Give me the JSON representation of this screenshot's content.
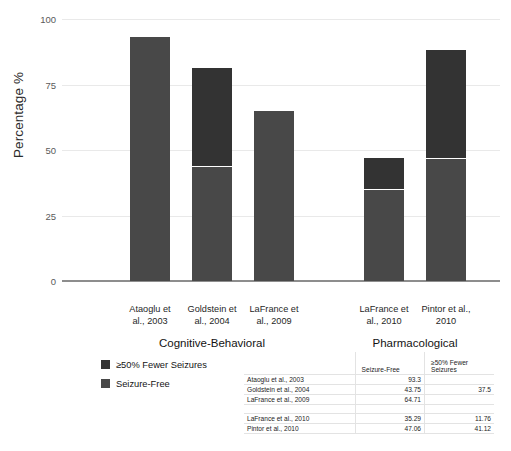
{
  "chart_data": {
    "type": "bar",
    "subtype": "stacked-bar",
    "title": "",
    "xlabel": "",
    "ylabel": "Percentage %",
    "ylim": [
      0,
      100
    ],
    "yticks": [
      0,
      25,
      50,
      75,
      100
    ],
    "ytick_labels": [
      "0",
      "25",
      "50",
      "75",
      "100"
    ],
    "grid": true,
    "legend_position": "below-left",
    "categories": [
      "Ataoglu et al., 2003",
      "Goldstein et al., 2004",
      "LaFrance et al., 2009",
      "LaFrance et al., 2010",
      "Pintor et al., 2010"
    ],
    "category_lines": [
      [
        "Ataoglu et",
        "al., 2003"
      ],
      [
        "Goldstein et",
        "al., 2004"
      ],
      [
        "LaFrance et",
        "al., 2009"
      ],
      [
        "LaFrance et",
        "al., 2010"
      ],
      [
        "Pintor et al.,",
        "2010"
      ]
    ],
    "groups": [
      {
        "label": "Cognitive-Behavioral",
        "categories": [
          0,
          1,
          2
        ]
      },
      {
        "label": "Pharmacological",
        "categories": [
          3,
          4
        ]
      }
    ],
    "series": [
      {
        "name": "Seizure-Free",
        "color": "#484848",
        "values": [
          93.3,
          43.75,
          64.71,
          35.29,
          47.06
        ]
      },
      {
        "name": "≥50% Fewer Seizures",
        "color": "#333333",
        "values": [
          null,
          37.5,
          null,
          11.76,
          41.12
        ]
      }
    ],
    "totals": [
      93.3,
      81.25,
      64.71,
      47.05,
      88.18
    ]
  },
  "axis": {
    "y_title": "Percentage %",
    "y_ticks": [
      "100",
      "75",
      "50",
      "25",
      "0"
    ]
  },
  "bars": [
    {
      "study": "Ataoglu et al., 2003",
      "line1": "Ataoglu et",
      "line2": "al., 2003",
      "free": 93.3,
      "fewer": 0
    },
    {
      "study": "Goldstein et al., 2004",
      "line1": "Goldstein et",
      "line2": "al., 2004",
      "free": 43.75,
      "fewer": 37.5
    },
    {
      "study": "LaFrance et al., 2009",
      "line1": "LaFrance et",
      "line2": "al., 2009",
      "free": 64.71,
      "fewer": 0
    },
    {
      "study": "LaFrance et al., 2010",
      "line1": "LaFrance et",
      "line2": "al., 2010",
      "free": 35.29,
      "fewer": 11.76
    },
    {
      "study": "Pintor et al., 2010",
      "line1": "Pintor et al.,",
      "line2": "2010",
      "free": 47.06,
      "fewer": 41.12
    }
  ],
  "groups": {
    "cbt": "Cognitive-Behavioral",
    "pharm": "Pharmacological"
  },
  "legend": {
    "items": [
      {
        "label": "≥50% Fewer Seizures",
        "color": "#333333"
      },
      {
        "label": "Seizure-Free",
        "color": "#484848"
      }
    ]
  },
  "table": {
    "headers": [
      "",
      "Seizure-Free",
      "≥50% Fewer Seizures"
    ],
    "header_col2": "Seizure-Free",
    "header_col3_line1": "≥50% Fewer",
    "header_col3_line2": "Seizures",
    "rows": [
      {
        "study": "Ataoglu et al., 2003",
        "seizure_free": "93.3",
        "fewer_seizures": ""
      },
      {
        "study": "Goldstein et al., 2004",
        "seizure_free": "43.75",
        "fewer_seizures": "37.5"
      },
      {
        "study": "LaFrance et al., 2009",
        "seizure_free": "64.71",
        "fewer_seizures": ""
      },
      {
        "study": "LaFrance et al., 2010",
        "seizure_free": "35.29",
        "fewer_seizures": "11.76"
      },
      {
        "study": "Pintor et al., 2010",
        "seizure_free": "47.06",
        "fewer_seizures": "41.12"
      }
    ]
  },
  "colors": {
    "seizure_free": "#484848",
    "fewer_seizures": "#333333",
    "grid": "#e9e9e9",
    "axis": "#8d8d8d"
  }
}
